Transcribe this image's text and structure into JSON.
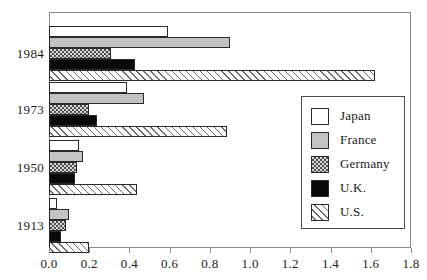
{
  "chart_data": {
    "type": "bar",
    "orientation": "horizontal",
    "title": "",
    "xlabel": "",
    "ylabel": "",
    "xlim": [
      0.0,
      1.8
    ],
    "grid": false,
    "legend_position": "center-right",
    "categories": [
      "1984",
      "1973",
      "1950",
      "1913"
    ],
    "xticks": [
      "0.0",
      "0.2",
      "0.4",
      "0.6",
      "0.8",
      "1.0",
      "1.2",
      "1.4",
      "1.6",
      "1.8"
    ],
    "xtick_values": [
      0.0,
      0.2,
      0.4,
      0.6,
      0.8,
      1.0,
      1.2,
      1.4,
      1.6,
      1.8
    ],
    "series": [
      {
        "name": "Japan",
        "key": "japan",
        "fill": "white",
        "values": [
          0.59,
          0.39,
          0.15,
          0.04
        ]
      },
      {
        "name": "France",
        "key": "france",
        "fill": "gray",
        "values": [
          0.9,
          0.47,
          0.17,
          0.1
        ]
      },
      {
        "name": "Germany",
        "key": "germany",
        "fill": "checkered",
        "values": [
          0.31,
          0.2,
          0.14,
          0.085
        ]
      },
      {
        "name": "U.K.",
        "key": "uk",
        "fill": "black",
        "values": [
          0.43,
          0.24,
          0.13,
          0.06
        ]
      },
      {
        "name": "U.S.",
        "key": "us",
        "fill": "diagonal",
        "values": [
          1.62,
          0.885,
          0.44,
          0.2
        ]
      }
    ]
  },
  "legend": {
    "items": [
      {
        "label": "Japan"
      },
      {
        "label": "France"
      },
      {
        "label": "Germany"
      },
      {
        "label": "U.K."
      },
      {
        "label": "U.S."
      }
    ]
  },
  "colors": {
    "japan": "#ffffff",
    "france": "#c3c3c3",
    "germany": "#d8d8d8",
    "uk": "#0a0a0a",
    "us": "#f2f2f2",
    "axis": "#8a8a8a",
    "text": "#1a1a1a"
  }
}
